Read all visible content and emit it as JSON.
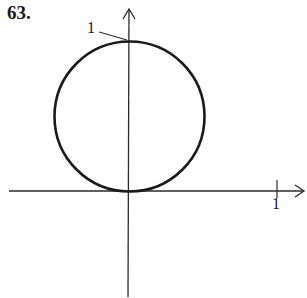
{
  "problem_number": "63.",
  "figure": {
    "type": "polar-curve-graph",
    "y_axis_label": "1",
    "x_axis_label": "1",
    "circle": {
      "center": [
        0,
        0.5
      ],
      "radius": 0.5
    },
    "stroke_color": "#1a1a1a"
  }
}
